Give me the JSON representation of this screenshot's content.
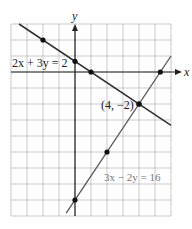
{
  "chart_data": {
    "type": "line",
    "title": "",
    "xlabel": "x",
    "ylabel": "y",
    "xlim": [
      -4,
      6
    ],
    "ylim": [
      -9,
      3
    ],
    "grid": true,
    "legend": "none",
    "series": [
      {
        "name": "2x + 3y = 2",
        "equation": "2x + 3y = 2",
        "points": [
          [
            -2,
            2
          ],
          [
            0,
            0.667
          ],
          [
            1,
            0
          ],
          [
            4,
            -2
          ]
        ],
        "color": "#333333"
      },
      {
        "name": "3x - 2y = 16",
        "equation": "3x - 2y = 16",
        "points": [
          [
            0,
            -8
          ],
          [
            2,
            -5
          ],
          [
            4,
            -2
          ],
          [
            5.333,
            0
          ]
        ],
        "color": "#555555"
      }
    ],
    "annotations": [
      {
        "text": "(4, -2)",
        "x": 4,
        "y": -2,
        "note": "intersection point"
      },
      {
        "text": "2x + 3y = 2",
        "label_for": "line 1"
      },
      {
        "text": "3x - 2y = 16",
        "label_for": "line 2"
      }
    ]
  },
  "labels": {
    "x_axis": "x",
    "y_axis": "y",
    "eq1": "2x + 3y = 2",
    "eq2": "3x − 2y = 16",
    "intersection": "(4, −2)"
  }
}
